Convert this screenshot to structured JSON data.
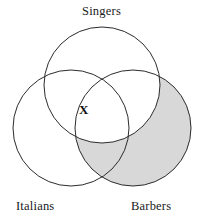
{
  "figure": {
    "kind": "venn-diagram",
    "set_count": 3,
    "background_color": "#ffffff",
    "stroke_color": "#2b2b2b",
    "stroke_width": 1,
    "shade_color": "#d8d8d8",
    "width": 203,
    "height": 219
  },
  "labels": {
    "singers": "Singers",
    "italians": "Italians",
    "barbers": "Barbers"
  },
  "circles": [
    {
      "name": "singers",
      "label": "Singers",
      "cx": 102,
      "cy": 85,
      "r": 58
    },
    {
      "name": "italians",
      "label": "Italians",
      "cx": 71,
      "cy": 128,
      "r": 58
    },
    {
      "name": "barbers",
      "label": "Barbers",
      "cx": 133,
      "cy": 128,
      "r": 58
    }
  ],
  "shaded_region": {
    "description": "Barbers and not Singers",
    "sets_included": [
      "barbers"
    ],
    "sets_excluded": [
      "singers"
    ],
    "color": "#d8d8d8"
  },
  "markers": [
    {
      "name": "x-mark",
      "glyph": "X",
      "x": 86,
      "y": 113,
      "region": "Singers and Italians, not Barbers"
    }
  ]
}
